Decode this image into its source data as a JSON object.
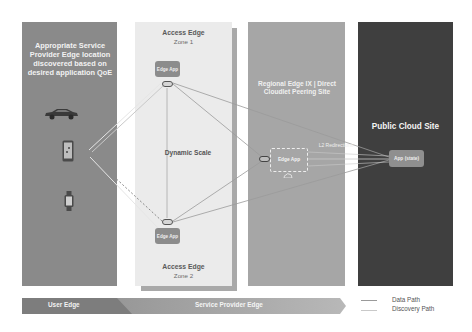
{
  "panels": {
    "user": {
      "title": "Appropriate Service Provider Edge location discovered based on desired application QoE",
      "devices": [
        "car-icon",
        "smartphone-icon",
        "smartwatch-icon"
      ]
    },
    "access_zone1": {
      "title": "Access Edge",
      "zone": "Zone 1",
      "app_label": "Edge App"
    },
    "access_zone2": {
      "title": "Access Edge",
      "zone": "Zone 2",
      "app_label": "Edge App"
    },
    "dynamic_scale": "Dynamic Scale",
    "regional": {
      "title": "Regional Edge IX | Direct Cloudlet Peering Site",
      "app_label": "Edge App",
      "l2_label": "L2 Redirections"
    },
    "cloud": {
      "title": "Public Cloud Site",
      "app_label": "App (state)"
    }
  },
  "band": {
    "user_edge": "User Edge",
    "service_provider_edge": "Service Provider Edge"
  },
  "legend": [
    {
      "label": "Data Path",
      "color": "#9a9a9a"
    },
    {
      "label": "Discovery Path",
      "color": "#c9c9c9"
    }
  ],
  "colors": {
    "user_panel": "#8a8a8a",
    "access_panel": "#ebebeb",
    "regional_panel": "#a6a6a6",
    "cloud_panel": "#3f3f3f"
  }
}
